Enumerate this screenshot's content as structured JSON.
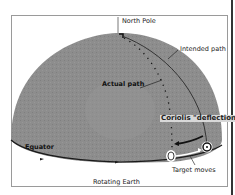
{
  "diagram": {
    "title": "Rotating Earth",
    "labels": {
      "north_pole": "North Pole",
      "intended_path": "Intended path",
      "actual_path": "Actual path",
      "coriolis": "Coriolis \"deflection\"",
      "equator": "Equator",
      "target_moves": "Target moves",
      "rotating_earth": "Rotating Earth"
    },
    "colors": {
      "globe": "#8c8c8c",
      "globe_dark": "#7a7a7a",
      "lines": "#1a1a1a",
      "frame": "#9a9a9a",
      "coriolis_bg": "#d8d8d8"
    }
  }
}
